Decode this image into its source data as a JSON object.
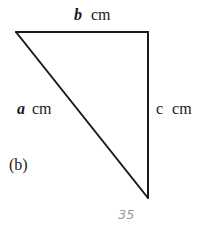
{
  "figure": {
    "panel_label": "(b)",
    "shape": "right-triangle",
    "sides": [
      {
        "id": "top",
        "variable": "b",
        "unit": "cm",
        "variable_style": "bold-italic"
      },
      {
        "id": "hypotenuse",
        "variable": "a",
        "unit": "cm",
        "variable_style": "bold-italic"
      },
      {
        "id": "right",
        "variable": "c",
        "unit": "cm",
        "variable_style": "upright"
      }
    ],
    "handwritten_note": "35",
    "colors": {
      "ink": "#1a1a1a",
      "pencil": "#9a9a9a",
      "background": "#ffffff"
    }
  }
}
